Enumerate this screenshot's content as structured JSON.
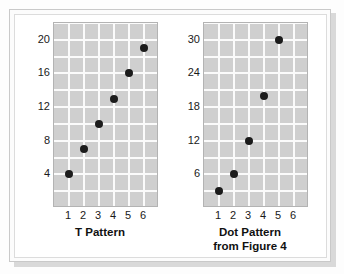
{
  "figure": {
    "background_color": "#ffffff",
    "frame_color": "#c9c9c9",
    "plot_bg_color": "#cfcfcf",
    "gridline_color": "#fbfbfb",
    "dot_color": "#1c1c1c"
  },
  "chart_data": [
    {
      "type": "scatter",
      "title": "T Pattern",
      "title_lines": [
        "T Pattern"
      ],
      "xlabel": "",
      "ylabel": "",
      "x": [
        1,
        2,
        3,
        4,
        5,
        6
      ],
      "values": [
        4,
        7,
        10,
        13,
        16,
        19
      ],
      "points": [
        {
          "x": 1,
          "y": 4
        },
        {
          "x": 2,
          "y": 7
        },
        {
          "x": 3,
          "y": 10
        },
        {
          "x": 4,
          "y": 13
        },
        {
          "x": 5,
          "y": 16
        },
        {
          "x": 6,
          "y": 19
        }
      ],
      "xlim": [
        0,
        7
      ],
      "ylim": [
        0,
        22
      ],
      "xticks": [
        1,
        2,
        3,
        4,
        5,
        6
      ],
      "xtick_labels": [
        "1",
        "2",
        "3",
        "4",
        "5",
        "6"
      ],
      "yticks": [
        4,
        8,
        12,
        16,
        20
      ],
      "ytick_labels": [
        "20",
        "16",
        "12",
        "8",
        "4"
      ],
      "grid": true,
      "legend": "none"
    },
    {
      "type": "scatter",
      "title": "Dot Pattern from Figure 4",
      "title_lines": [
        "Dot Pattern",
        "from Figure 4"
      ],
      "xlabel": "",
      "ylabel": "",
      "x": [
        1,
        2,
        3,
        4,
        5
      ],
      "values": [
        3,
        6,
        12,
        20,
        30
      ],
      "points": [
        {
          "x": 1,
          "y": 3
        },
        {
          "x": 2,
          "y": 6
        },
        {
          "x": 3,
          "y": 12
        },
        {
          "x": 4,
          "y": 20
        },
        {
          "x": 5,
          "y": 30
        }
      ],
      "xlim": [
        0,
        7
      ],
      "ylim": [
        0,
        33
      ],
      "xticks": [
        1,
        2,
        3,
        4,
        5,
        6
      ],
      "xtick_labels": [
        "1",
        "2",
        "3",
        "4",
        "5",
        "6"
      ],
      "yticks": [
        6,
        12,
        18,
        24,
        30
      ],
      "ytick_labels": [
        "30",
        "24",
        "18",
        "12",
        "6"
      ],
      "grid": true,
      "legend": "none"
    }
  ]
}
